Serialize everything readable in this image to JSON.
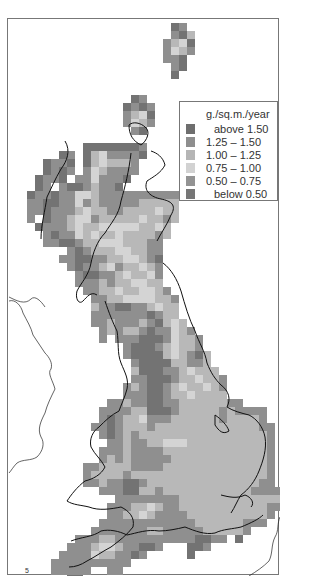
{
  "map": {
    "title": "",
    "units": "g./sq.m./year",
    "grid": {
      "origin_x": 10,
      "origin_y": 22,
      "cell": 8,
      "rows": [
        "....................AB............",
        "....................BAC...........",
        "...................BCDA...........",
        "...................BDCB...........",
        "...................BBA............",
        "....................BA............",
        "....................A.............",
        "..................................",
        "..................................",
        "...............AB.................",
        "..............ABAB................",
        "..............BCDA................",
        "..............BDCB................",
        "...............BA.................",
        "..................................",
        ".........AAAAAAAB.................",
        "......AB.ACDBBBBA.................",
        "....ABBA.ACDCCCB..................",
        "....ABAB.BDCBBBB..................",
        "...ABBA.BBDBBBA...................",
        "...AB.BAABCBBA....................",
        "..ABBABBDDCBBBBBBBBBB.............",
        "..BBAABBDBCBBBBBCCCCC.............",
        "..BBABBBCDCCBBCCCCDCC.............",
        "..B.ABBCDDBCCCCCDCCBC.............",
        "...ABBBCDCCDDDDDCCDC..............",
        "....BABBDCDCCDCCCCBC..............",
        "....BBAABCCDDDCCCBB...............",
        ".......BABCCCDDCCBB...............",
        "......BBAABBCCDDCBA...............",
        ".......BABBCDBCCDCB...............",
        "........BAABBCDCCDB...............",
        "........BBBCBCCDDCC...............",
        ".........BBCCDCCDDCB..............",
        "..........BBCCDDDDCCB.............",
        "..........CBBAABBCDCC.............",
        "..........BBBBBBBABCC.............",
        "..........BBCBBBCBACDC............",
        "...........BCBCCBABBDCB...........",
        "...........B.BBBAAABDCCB..........",
        "..............BAAABCDCCB..........",
        "..............BAAAACDCBAC.........",
        "...............BAAAACCBBC.........",
        "...............CAAABBCDCCC........",
        "...............BBAAABCCDCCB.......",
        "..............BCBAABCDCCDCB.......",
        "..............BBBAABCCDCCCC.......",
        "............BBCBBAABBCCCCCCBB.....",
        "...........BBBBCCAAABCCCCCBCBBBB..",
        "...........BABCCDBBBCCCCCCBCCCCB..",
        "..........BBABCCCBCCCCCCCCCCCCCBB.",
        "...........BABCBCCCCCCCCCCCCCCCCB.",
        "............BBCBBCCDDDCCCCCCCCCCB.",
        "...........BBBCBBBBCCCCCCCCCCCCCB.",
        "...........BCBCBBBBBCCCCCCCCCCCCB.",
        ".........BBCCCCBBBBCCCCCCCCCCCCCB.",
        ".........BCCCCBCCCCCCCCCCCCCCCCCB.",
        ".........BBCBBAABCCCCCCCCCCCCCCBB.",
        "...........BBBAACCBCCCCCCCCCCCBBBB",
        ".............BBBBBBBBCCCCCCCCCCCCC",
        "............BBBCCDCBBCCCCCCCCCCCBB",
        "............BBCCDCBBBBCCCCCCCCCCB.",
        "...........BBBBBBBBBBBBCCCCCCBBB..",
        "..........BBBBBBBCCBBBBBCCCCCB....",
        "........BBBCCBBBBBBBBBBAABB.A.....",
        ".......BBBCDDCBBAAB...AAB.........",
        "......BBBBDCCBBAB.....A...........",
        ".....BBBBBBBBBB...................",
        ".....BBBBB..BB....................",
        ".......AA........................."
      ]
    },
    "shade_colors": {
      "A": "#737373",
      "B": "#8f8f8f",
      "C": "#b8b8b8",
      "D": "#d4d4d4",
      "E": "#9a9a9a",
      "F": "#7a7a7a"
    },
    "legend": {
      "title": "g./sq.m./year",
      "items": [
        {
          "label": "above  1.50",
          "color": "#6e6e6e"
        },
        {
          "label": "1.25  –  1.50",
          "color": "#8e8e8e"
        },
        {
          "label": "1.00  –  1.25",
          "color": "#b5b5b5"
        },
        {
          "label": "0.75  –  1.00",
          "color": "#d2d2d2"
        },
        {
          "label": "0.50  –  0.75",
          "color": "#939393"
        },
        {
          "label": "below  0.50",
          "color": "#767676"
        }
      ]
    },
    "annotations": {
      "corner_mark": "5"
    }
  }
}
